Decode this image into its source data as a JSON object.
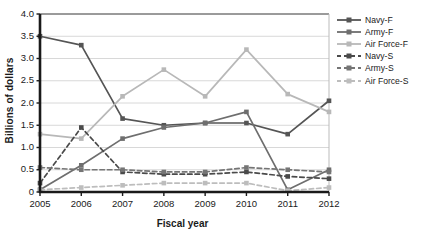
{
  "chart_data": {
    "type": "line",
    "title": "",
    "xlabel": "Fiscal year",
    "ylabel": "Billions of dollars",
    "categories": [
      "2005",
      "2006",
      "2007",
      "2008",
      "2009",
      "2010",
      "2011",
      "2012"
    ],
    "x": [
      2005,
      2006,
      2007,
      2008,
      2009,
      2010,
      2011,
      2012
    ],
    "xlim": [
      2005,
      2012
    ],
    "ylim": [
      0,
      4.0
    ],
    "yticks": [
      "0",
      "0.5",
      "1.0",
      "1.5",
      "2.0",
      "2.5",
      "3.0",
      "3.5",
      "4.0"
    ],
    "ytick_values": [
      0,
      0.5,
      1.0,
      1.5,
      2.0,
      2.5,
      3.0,
      3.5,
      4.0
    ],
    "grid": "horizontal",
    "legend_position": "right",
    "series": [
      {
        "name": "Navy-F",
        "color": "#555555",
        "style": "solid",
        "marker": "square",
        "values": [
          3.5,
          3.3,
          1.65,
          1.5,
          1.55,
          1.55,
          1.3,
          2.05
        ]
      },
      {
        "name": "Army-F",
        "color": "#6e6e6e",
        "style": "solid",
        "marker": "square",
        "values": [
          0.05,
          0.6,
          1.2,
          1.45,
          1.55,
          1.8,
          0.05,
          0.5
        ]
      },
      {
        "name": "Air Force-F",
        "color": "#b8b8b8",
        "style": "solid",
        "marker": "square",
        "values": [
          1.3,
          1.2,
          2.15,
          2.75,
          2.15,
          3.2,
          2.2,
          1.8
        ]
      },
      {
        "name": "Navy-S",
        "color": "#4a4a4a",
        "style": "dashed",
        "marker": "square",
        "values": [
          0.2,
          1.45,
          0.45,
          0.4,
          0.4,
          0.45,
          0.35,
          0.3
        ]
      },
      {
        "name": "Army-S",
        "color": "#757575",
        "style": "dashed",
        "marker": "square",
        "values": [
          0.55,
          0.5,
          0.5,
          0.45,
          0.45,
          0.55,
          0.5,
          0.45
        ]
      },
      {
        "name": "Air Force-S",
        "color": "#bdbdbd",
        "style": "dashed",
        "marker": "square",
        "values": [
          0.05,
          0.1,
          0.15,
          0.2,
          0.2,
          0.2,
          0.03,
          0.1
        ]
      }
    ]
  },
  "axes": {
    "ylabel": "Billions of dollars",
    "xlabel": "Fiscal year"
  },
  "legend": {
    "items": [
      {
        "label": "Navy-F"
      },
      {
        "label": "Army-F"
      },
      {
        "label": "Air Force-F"
      },
      {
        "label": "Navy-S"
      },
      {
        "label": "Army-S"
      },
      {
        "label": "Air Force-S"
      }
    ]
  },
  "colors": {
    "axis": "#1a1a1a",
    "grid": "#d8d8d8",
    "background": "#ffffff"
  }
}
